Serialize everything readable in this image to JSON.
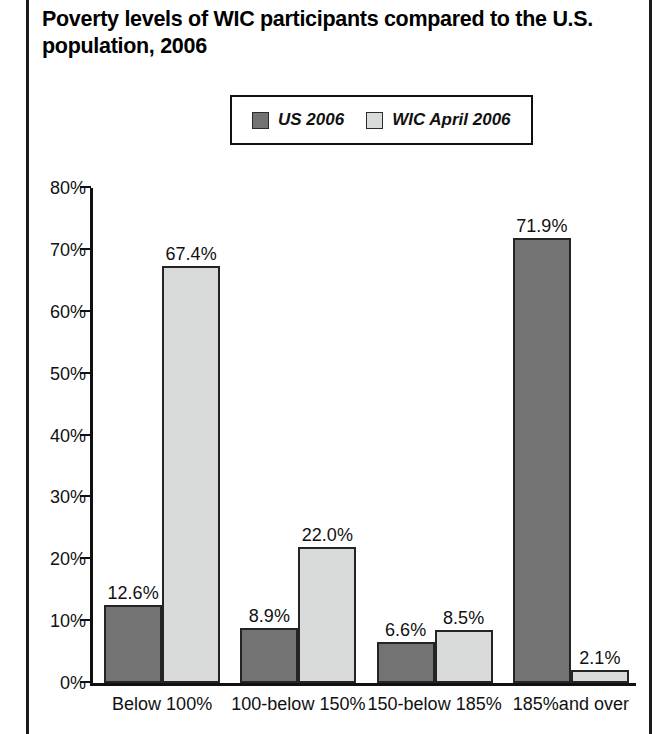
{
  "title": "Poverty levels of WIC participants compared to the U.S. population, 2006",
  "legend": {
    "items": [
      {
        "label": "US 2006",
        "color": "#737373"
      },
      {
        "label": "WIC April 2006",
        "color": "#d9dbdb"
      }
    ]
  },
  "chart_data": {
    "type": "bar",
    "title": "Poverty levels of WIC participants compared to the U.S. population, 2006",
    "xlabel": "",
    "ylabel": "",
    "ylim": [
      0,
      80
    ],
    "ytick_labels": [
      "0%",
      "10%",
      "20%",
      "30%",
      "40%",
      "50%",
      "60%",
      "70%",
      "80%"
    ],
    "ytick_values": [
      0,
      10,
      20,
      30,
      40,
      50,
      60,
      70,
      80
    ],
    "grid": false,
    "legend_position": "top-center",
    "categories": [
      "Below 100%",
      "100-below 150%",
      "150-below 185%",
      "185%and over"
    ],
    "series": [
      {
        "name": "US 2006",
        "color": "#737373",
        "values": [
          12.6,
          8.9,
          6.6,
          71.9
        ],
        "value_labels": [
          "12.6%",
          "8.9%",
          "6.6%",
          "71.9%"
        ]
      },
      {
        "name": "WIC April 2006",
        "color": "#d9dbdb",
        "values": [
          67.4,
          22.0,
          8.5,
          2.1
        ],
        "value_labels": [
          "67.4%",
          "22.0%",
          "8.5%",
          "2.1%"
        ]
      }
    ]
  }
}
